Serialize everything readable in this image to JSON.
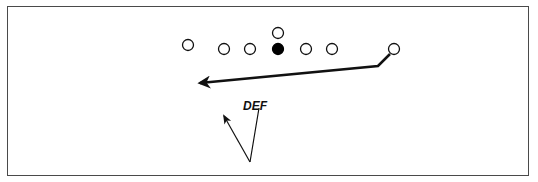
{
  "diagram": {
    "type": "football-play",
    "colors": {
      "stroke": "#111111",
      "border": "#4a4a4a",
      "background": "#ffffff",
      "filled_player": "#000000"
    },
    "players": [
      {
        "id": "p1",
        "x": 188,
        "y": 45,
        "filled": false
      },
      {
        "id": "p2",
        "x": 224,
        "y": 49,
        "filled": false
      },
      {
        "id": "p3",
        "x": 250,
        "y": 49,
        "filled": false
      },
      {
        "id": "center",
        "x": 278,
        "y": 49,
        "filled": true
      },
      {
        "id": "p5",
        "x": 306,
        "y": 49,
        "filled": false
      },
      {
        "id": "p6",
        "x": 332,
        "y": 49,
        "filled": false
      },
      {
        "id": "p7",
        "x": 394,
        "y": 49,
        "filled": false
      },
      {
        "id": "qb",
        "x": 278,
        "y": 33,
        "filled": false
      }
    ],
    "routes": [
      {
        "id": "receiver-route",
        "points": [
          [
            389,
            54
          ],
          [
            378,
            66
          ],
          [
            200,
            83
          ]
        ],
        "arrow": true,
        "thick": true
      }
    ],
    "defender": {
      "label": "DEF",
      "label_x": 243,
      "label_y": 110,
      "origin": [
        250,
        162
      ],
      "lines": [
        {
          "to": [
            259,
            109
          ],
          "arrow": false
        },
        {
          "to": [
            223,
            114
          ],
          "arrow": true
        }
      ]
    }
  }
}
